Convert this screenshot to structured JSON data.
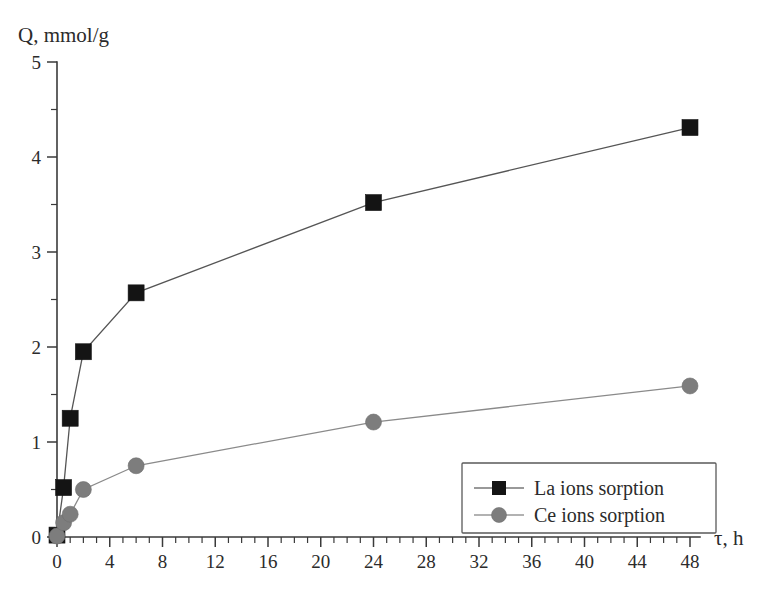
{
  "chart_data": {
    "type": "line",
    "title": "",
    "xlabel": "τ, h",
    "ylabel": "Q, mmol/g",
    "xlim": [
      0,
      48
    ],
    "ylim": [
      0,
      5
    ],
    "grid": false,
    "legend_position": "bottom-right",
    "x_ticks": [
      0,
      4,
      8,
      12,
      16,
      20,
      24,
      28,
      32,
      36,
      40,
      44,
      48
    ],
    "x_tick_labels": [
      "0",
      "4",
      "8",
      "12",
      "16",
      "20",
      "24",
      "28",
      "32",
      "36",
      "40",
      "44",
      "48"
    ],
    "x_minor_step": 1,
    "y_ticks": [
      0,
      1,
      2,
      3,
      4,
      5
    ],
    "y_tick_labels": [
      "0",
      "1",
      "2",
      "3",
      "4",
      "5"
    ],
    "y_minor_step": 0.5,
    "series": [
      {
        "name": "La ions sorption",
        "marker": "square",
        "color": "#141414",
        "line_color": "#555555",
        "x": [
          0,
          0.5,
          1,
          2,
          6,
          24,
          48
        ],
        "values": [
          0.02,
          0.52,
          1.25,
          1.95,
          2.57,
          3.52,
          4.31
        ]
      },
      {
        "name": "Ce ions sorption",
        "marker": "circle",
        "color": "#7d7d7d",
        "line_color": "#8a8a8a",
        "x": [
          0,
          0.5,
          1,
          2,
          6,
          24,
          48
        ],
        "values": [
          0.01,
          0.15,
          0.24,
          0.5,
          0.75,
          1.21,
          1.59
        ]
      }
    ]
  },
  "legend": {
    "items": [
      {
        "label": "La ions sorption",
        "marker": "square-marker",
        "color": "#141414"
      },
      {
        "label": "Ce ions sorption",
        "marker": "circle-marker",
        "color": "#7d7d7d"
      }
    ]
  }
}
